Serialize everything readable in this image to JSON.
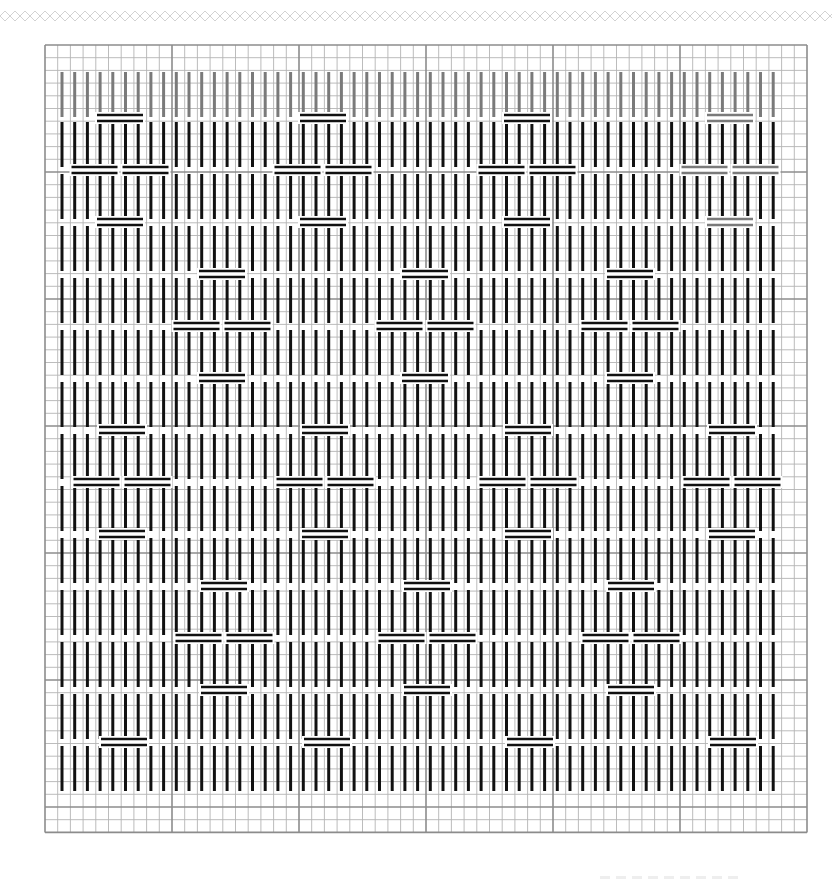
{
  "colors": {
    "background": "#ffffff",
    "grid_minor": "#b4b4b4",
    "grid_major": "#8c8c8c",
    "stitch_primary": "#111111",
    "stitch_faded": "#7a7a7a",
    "deco": "#d2d2d2"
  },
  "grid": {
    "left": 45,
    "top": 45,
    "cell": 12.7,
    "cols": 60,
    "rows": 62,
    "major_every": 10
  },
  "stitches": {
    "columns": 57,
    "first_x": 62,
    "step_x": 12.7,
    "row_tops": [
      72,
      122,
      174,
      226,
      278,
      330,
      382,
      434,
      486,
      538,
      590,
      642,
      694,
      746
    ],
    "row_height": 45,
    "faded_rows": [
      0
    ]
  },
  "motifs": {
    "bar_width": 46,
    "bar_gap": 5,
    "items": [
      {
        "cx": 120,
        "top": 118,
        "mid": 170,
        "bottom": 222,
        "faded": false
      },
      {
        "cx": 323,
        "top": 118,
        "mid": 170,
        "bottom": 222,
        "faded": false
      },
      {
        "cx": 527,
        "top": 118,
        "mid": 170,
        "bottom": 222,
        "faded": false
      },
      {
        "cx": 730,
        "top": 118,
        "mid": 170,
        "bottom": 222,
        "faded": true
      },
      {
        "cx": 222,
        "top": 274,
        "mid": 326,
        "bottom": 378,
        "faded": false
      },
      {
        "cx": 425,
        "top": 274,
        "mid": 326,
        "bottom": 378,
        "faded": false
      },
      {
        "cx": 630,
        "top": 274,
        "mid": 326,
        "bottom": 378,
        "faded": false
      },
      {
        "cx": 122,
        "top": 430,
        "mid": 482,
        "bottom": 534,
        "faded": false
      },
      {
        "cx": 325,
        "top": 430,
        "mid": 482,
        "bottom": 534,
        "faded": false
      },
      {
        "cx": 528,
        "top": 430,
        "mid": 482,
        "bottom": 534,
        "faded": false
      },
      {
        "cx": 732,
        "top": 430,
        "mid": 482,
        "bottom": 534,
        "faded": false
      },
      {
        "cx": 224,
        "top": 586,
        "mid": 638,
        "bottom": 690,
        "faded": false
      },
      {
        "cx": 427,
        "top": 586,
        "mid": 638,
        "bottom": 690,
        "faded": false
      },
      {
        "cx": 631,
        "top": 586,
        "mid": 638,
        "bottom": 690,
        "faded": false
      },
      {
        "cx": 124,
        "top": 742,
        "mid": null,
        "bottom": null,
        "faded": false
      },
      {
        "cx": 327,
        "top": 742,
        "mid": null,
        "bottom": null,
        "faded": false
      },
      {
        "cx": 530,
        "top": 742,
        "mid": null,
        "bottom": null,
        "faded": false
      },
      {
        "cx": 733,
        "top": 742,
        "mid": null,
        "bottom": null,
        "faded": false
      }
    ]
  }
}
